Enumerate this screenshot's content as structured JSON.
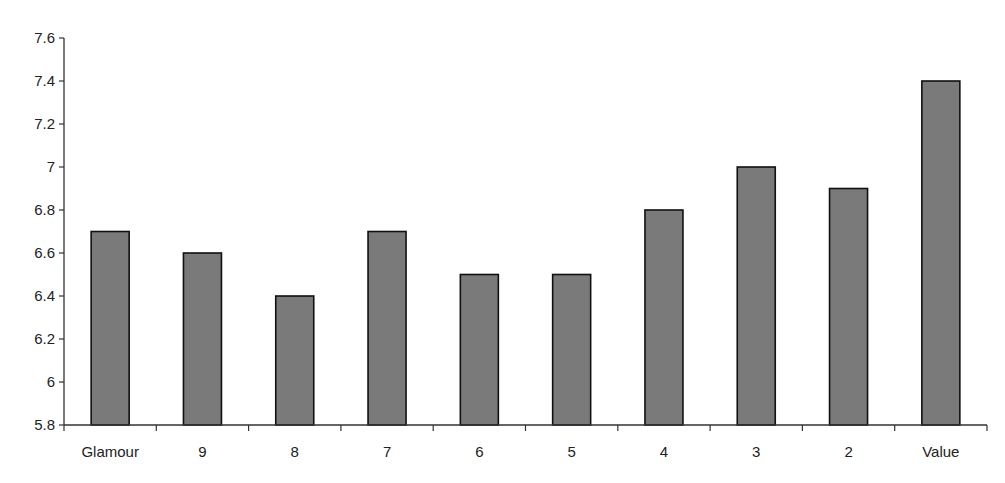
{
  "chart_data": {
    "type": "bar",
    "title": "",
    "xlabel": "",
    "ylabel": "",
    "categories": [
      "Glamour",
      "9",
      "8",
      "7",
      "6",
      "5",
      "4",
      "3",
      "2",
      "Value"
    ],
    "values": [
      6.7,
      6.6,
      6.4,
      6.7,
      6.5,
      6.5,
      6.8,
      7.0,
      6.9,
      7.4
    ],
    "ylim": [
      5.8,
      7.6
    ],
    "yticks": [
      "5.8",
      "6",
      "6.2",
      "6.4",
      "6.6",
      "6.8",
      "7",
      "7.2",
      "7.4",
      "7.6"
    ],
    "grid": false,
    "legend": null,
    "colors": {
      "bar_fill": "#7a7a7a",
      "bar_stroke": "#111111",
      "axis": "#333333"
    }
  }
}
